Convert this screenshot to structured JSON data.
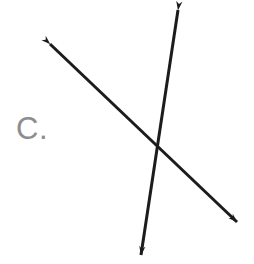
{
  "figure": {
    "name": "intersecting-lines-figure",
    "background_color": "#ffffff",
    "width": 254,
    "height": 264
  },
  "label": {
    "text": "C.",
    "color": "#8d8d8d"
  },
  "chart_data": {
    "type": "diagram",
    "title": "",
    "subtitle": "",
    "xlabel": "",
    "ylabel": "",
    "stroke_color": "#1c1c1c",
    "stroke_width": 3,
    "intersection": {
      "x": 157,
      "y": 153
    },
    "lines": [
      {
        "name": "shallow-line",
        "orientation": "northwest-to-southeast",
        "arrowheads": "both",
        "start": {
          "x": 50,
          "y": 44
        },
        "end": {
          "x": 237,
          "y": 222
        },
        "slope_deg": 43.6
      },
      {
        "name": "steep-line",
        "orientation": "north-northeast-to-south-southwest",
        "arrowheads": "both",
        "start": {
          "x": 178,
          "y": 10
        },
        "end": {
          "x": 141,
          "y": 255
        },
        "slope_deg": -81.4
      }
    ],
    "legend": [],
    "annotations": [
      {
        "text": "C.",
        "x": 18,
        "y": 133,
        "color": "#8d8d8d"
      }
    ]
  }
}
